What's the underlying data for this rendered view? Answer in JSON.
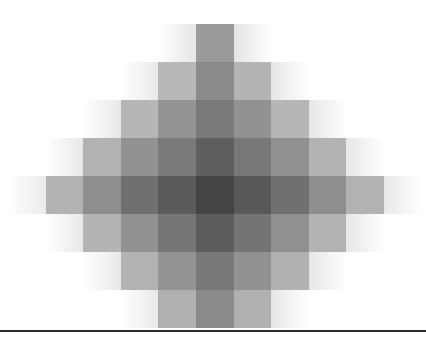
{
  "figure": {
    "grid": {
      "origin_x": 8,
      "origin_y": 24,
      "cell_w": 37.6,
      "cell_h": 38,
      "rows": [
        {
          "row": 0,
          "cells": [
            [
              4,
              "#e6e6e6",
              "fadeL"
            ],
            [
              5,
              "#9a9a9a"
            ],
            [
              6,
              "#e4e4e4",
              "fadeR"
            ]
          ]
        },
        {
          "row": 1,
          "cells": [
            [
              3,
              "#e8e8e8",
              "fadeL"
            ],
            [
              4,
              "#b8b8b8"
            ],
            [
              5,
              "#8a8a8a"
            ],
            [
              6,
              "#b4b4b4"
            ],
            [
              7,
              "#e6e6e6",
              "fadeR"
            ]
          ]
        },
        {
          "row": 2,
          "cells": [
            [
              2,
              "#e8e8e8",
              "fadeL"
            ],
            [
              3,
              "#b6b6b6"
            ],
            [
              4,
              "#949494"
            ],
            [
              5,
              "#7a7a7a"
            ],
            [
              6,
              "#929292"
            ],
            [
              7,
              "#b6b6b6"
            ],
            [
              8,
              "#e6e6e6",
              "fadeR"
            ]
          ]
        },
        {
          "row": 3,
          "cells": [
            [
              1,
              "#e8e8e8",
              "fadeL"
            ],
            [
              2,
              "#b2b2b2"
            ],
            [
              3,
              "#929292"
            ],
            [
              4,
              "#7a7a7a"
            ],
            [
              5,
              "#5e5e5e"
            ],
            [
              6,
              "#787878"
            ],
            [
              7,
              "#909090"
            ],
            [
              8,
              "#b2b2b2"
            ],
            [
              9,
              "#e6e6e6",
              "fadeR"
            ]
          ]
        },
        {
          "row": 4,
          "cells": [
            [
              0,
              "#eaeaea",
              "fadeL"
            ],
            [
              1,
              "#b2b2b2"
            ],
            [
              2,
              "#8e8e8e"
            ],
            [
              3,
              "#707070"
            ],
            [
              4,
              "#5a5a5a"
            ],
            [
              5,
              "#444444"
            ],
            [
              6,
              "#585858"
            ],
            [
              7,
              "#707070"
            ],
            [
              8,
              "#8e8e8e"
            ],
            [
              9,
              "#b2b2b2"
            ],
            [
              10,
              "#e8e8e8",
              "fadeR"
            ]
          ]
        },
        {
          "row": 5,
          "cells": [
            [
              1,
              "#e8e8e8",
              "fadeL"
            ],
            [
              2,
              "#b4b4b4"
            ],
            [
              3,
              "#929292"
            ],
            [
              4,
              "#767676"
            ],
            [
              5,
              "#5c5c5c"
            ],
            [
              6,
              "#747474"
            ],
            [
              7,
              "#909090"
            ],
            [
              8,
              "#b2b2b2"
            ],
            [
              9,
              "#e6e6e6",
              "fadeR"
            ]
          ]
        },
        {
          "row": 6,
          "cells": [
            [
              2,
              "#e8e8e8",
              "fadeL"
            ],
            [
              3,
              "#b2b2b2"
            ],
            [
              4,
              "#949494"
            ],
            [
              5,
              "#787878"
            ],
            [
              6,
              "#929292"
            ],
            [
              7,
              "#b0b0b0"
            ],
            [
              8,
              "#e6e6e6",
              "fadeR"
            ]
          ]
        },
        {
          "row": 7,
          "cells": [
            [
              3,
              "#e8e8e8",
              "fadeL"
            ],
            [
              4,
              "#b0b0b0"
            ],
            [
              5,
              "#8a8a8a"
            ],
            [
              6,
              "#b0b0b0"
            ],
            [
              7,
              "#e6e6e6",
              "fadeR"
            ]
          ]
        }
      ]
    },
    "baseline_color": "#2a2a2a"
  }
}
